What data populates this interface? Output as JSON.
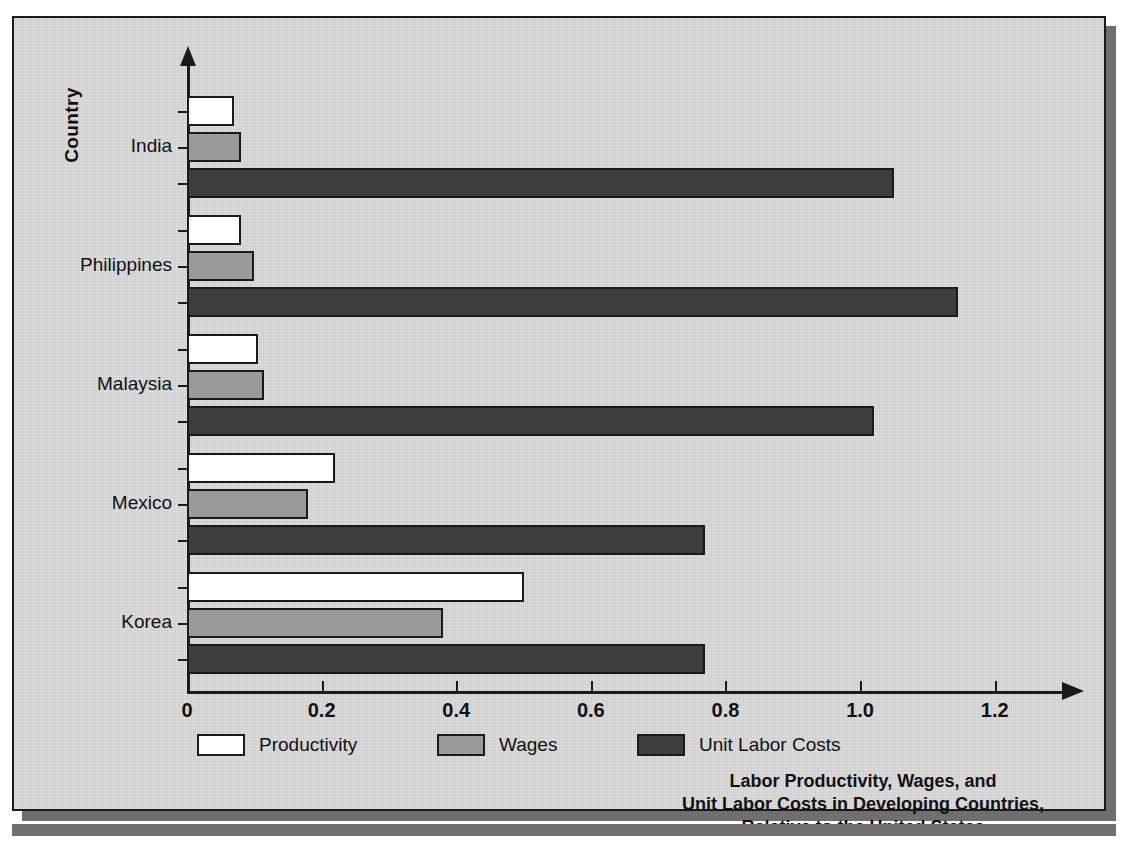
{
  "figure": {
    "y_axis_title": "Country",
    "caption_lines": [
      "Labor Productivity, Wages, and",
      "Unit Labor Costs in Developing Countries,",
      "Relative to the United States"
    ]
  },
  "legend": {
    "items": [
      {
        "label": "Productivity",
        "color": "#ffffff"
      },
      {
        "label": "Wages",
        "color": "#9a9a9a"
      },
      {
        "label": "Unit Labor Costs",
        "color": "#3d3d3d"
      }
    ]
  },
  "chart_data": {
    "type": "bar",
    "orientation": "horizontal",
    "xlabel": "",
    "ylabel": "Country",
    "xlim": [
      0,
      1.3
    ],
    "xticks": [
      0,
      0.2,
      0.4,
      0.6,
      0.8,
      1.0,
      1.2
    ],
    "xticklabels": [
      "0",
      "0.2",
      "0.4",
      "0.6",
      "0.8",
      "1.0",
      "1.2"
    ],
    "grid": false,
    "legend_position": "bottom-left",
    "categories": [
      "India",
      "Philippines",
      "Malaysia",
      "Mexico",
      "Korea"
    ],
    "series": [
      {
        "name": "Productivity",
        "color": "#ffffff",
        "values": [
          0.07,
          0.08,
          0.105,
          0.22,
          0.5
        ]
      },
      {
        "name": "Wages",
        "color": "#9a9a9a",
        "values": [
          0.08,
          0.1,
          0.115,
          0.18,
          0.38
        ]
      },
      {
        "name": "Unit Labor Costs",
        "color": "#3d3d3d",
        "values": [
          1.05,
          1.145,
          1.02,
          0.77,
          0.77
        ]
      }
    ]
  }
}
